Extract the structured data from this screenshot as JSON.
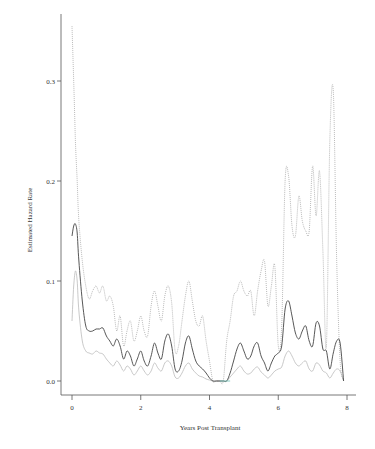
{
  "chart_data": {
    "type": "line",
    "title": "",
    "xlabel": "Years Post Transplant",
    "ylabel": "Estimated Hazard Rate",
    "xlim": [
      0,
      8
    ],
    "ylim": [
      0,
      0.36
    ],
    "xticks": [
      0,
      2,
      4,
      6,
      8
    ],
    "xtick_labels": [
      "0",
      "2",
      "4",
      "6",
      "8"
    ],
    "yticks": [
      0.0,
      0.1,
      0.2,
      0.3
    ],
    "ytick_labels": [
      "0.0",
      "0.1",
      "0.2",
      "0.3"
    ],
    "grid": false,
    "legend": null,
    "series": [
      {
        "name": "estimate",
        "style": "solid",
        "color": "#444444",
        "x": [
          0.0,
          0.05,
          0.1,
          0.15,
          0.2,
          0.3,
          0.4,
          0.5,
          0.6,
          0.7,
          0.8,
          0.9,
          1.0,
          1.1,
          1.2,
          1.3,
          1.4,
          1.5,
          1.6,
          1.7,
          1.8,
          1.9,
          2.0,
          2.1,
          2.2,
          2.3,
          2.4,
          2.5,
          2.6,
          2.7,
          2.8,
          2.9,
          3.0,
          3.1,
          3.2,
          3.3,
          3.4,
          3.5,
          3.6,
          3.7,
          3.8,
          3.9,
          4.0,
          4.1,
          4.2,
          4.3,
          4.4,
          4.5,
          4.6,
          4.7,
          4.8,
          4.9,
          5.0,
          5.1,
          5.2,
          5.3,
          5.4,
          5.5,
          5.6,
          5.7,
          5.8,
          5.9,
          6.0,
          6.1,
          6.2,
          6.3,
          6.4,
          6.5,
          6.6,
          6.7,
          6.8,
          6.9,
          7.0,
          7.1,
          7.2,
          7.3,
          7.4,
          7.5,
          7.6,
          7.7,
          7.8,
          7.9
        ],
        "values": [
          0.145,
          0.155,
          0.157,
          0.148,
          0.12,
          0.08,
          0.055,
          0.05,
          0.05,
          0.052,
          0.052,
          0.053,
          0.045,
          0.04,
          0.035,
          0.042,
          0.035,
          0.022,
          0.03,
          0.025,
          0.015,
          0.022,
          0.03,
          0.02,
          0.015,
          0.025,
          0.038,
          0.028,
          0.022,
          0.04,
          0.047,
          0.035,
          0.012,
          0.01,
          0.02,
          0.038,
          0.045,
          0.032,
          0.02,
          0.015,
          0.012,
          0.008,
          0.003,
          0.0,
          0.0,
          0.0,
          0.0,
          0.0,
          0.008,
          0.02,
          0.032,
          0.038,
          0.03,
          0.022,
          0.025,
          0.035,
          0.038,
          0.025,
          0.018,
          0.01,
          0.018,
          0.025,
          0.028,
          0.035,
          0.072,
          0.08,
          0.065,
          0.048,
          0.042,
          0.05,
          0.055,
          0.04,
          0.035,
          0.058,
          0.055,
          0.032,
          0.03,
          0.012,
          0.028,
          0.04,
          0.038,
          0.0
        ]
      },
      {
        "name": "lower-bound",
        "style": "solid",
        "color": "#bbbbbb",
        "x": [
          0.0,
          0.05,
          0.1,
          0.15,
          0.2,
          0.3,
          0.4,
          0.5,
          0.6,
          0.7,
          0.8,
          0.9,
          1.0,
          1.1,
          1.2,
          1.3,
          1.4,
          1.5,
          1.6,
          1.7,
          1.8,
          1.9,
          2.0,
          2.1,
          2.2,
          2.3,
          2.4,
          2.5,
          2.6,
          2.7,
          2.8,
          2.9,
          3.0,
          3.1,
          3.2,
          3.3,
          3.4,
          3.5,
          3.6,
          3.7,
          3.8,
          3.9,
          4.0,
          4.1,
          4.2,
          4.3,
          4.4,
          4.5,
          4.6,
          4.7,
          4.8,
          4.9,
          5.0,
          5.1,
          5.2,
          5.3,
          5.4,
          5.5,
          5.6,
          5.7,
          5.8,
          5.9,
          6.0,
          6.1,
          6.2,
          6.3,
          6.4,
          6.5,
          6.6,
          6.7,
          6.8,
          6.9,
          7.0,
          7.1,
          7.2,
          7.3,
          7.4,
          7.5,
          7.6,
          7.7,
          7.8,
          7.9
        ],
        "values": [
          0.06,
          0.095,
          0.11,
          0.1,
          0.07,
          0.04,
          0.03,
          0.028,
          0.027,
          0.03,
          0.028,
          0.027,
          0.022,
          0.018,
          0.015,
          0.02,
          0.016,
          0.01,
          0.015,
          0.012,
          0.006,
          0.01,
          0.015,
          0.01,
          0.006,
          0.01,
          0.018,
          0.013,
          0.01,
          0.018,
          0.02,
          0.015,
          0.004,
          0.003,
          0.008,
          0.015,
          0.018,
          0.012,
          0.008,
          0.005,
          0.004,
          0.002,
          0.001,
          0.0,
          0.0,
          0.0,
          0.0,
          0.0,
          0.004,
          0.008,
          0.012,
          0.015,
          0.01,
          0.007,
          0.008,
          0.012,
          0.014,
          0.009,
          0.006,
          0.003,
          0.006,
          0.01,
          0.012,
          0.014,
          0.025,
          0.03,
          0.025,
          0.018,
          0.015,
          0.018,
          0.02,
          0.012,
          0.01,
          0.018,
          0.016,
          0.01,
          0.008,
          0.003,
          0.008,
          0.012,
          0.01,
          0.0
        ]
      },
      {
        "name": "upper-bound",
        "style": "dotted",
        "color": "#aaaaaa",
        "x": [
          0.0,
          0.05,
          0.1,
          0.15,
          0.2,
          0.3,
          0.4,
          0.5,
          0.6,
          0.7,
          0.8,
          0.9,
          1.0,
          1.1,
          1.2,
          1.3,
          1.4,
          1.5,
          1.6,
          1.7,
          1.8,
          1.9,
          2.0,
          2.1,
          2.2,
          2.3,
          2.4,
          2.5,
          2.6,
          2.7,
          2.8,
          2.9,
          3.0,
          3.1,
          3.2,
          3.3,
          3.4,
          3.5,
          3.6,
          3.7,
          3.8,
          3.9,
          4.0,
          4.1,
          4.2,
          4.3,
          4.4,
          4.5,
          4.6,
          4.7,
          4.8,
          4.9,
          5.0,
          5.1,
          5.2,
          5.3,
          5.4,
          5.5,
          5.6,
          5.7,
          5.8,
          5.9,
          6.0,
          6.1,
          6.2,
          6.3,
          6.4,
          6.5,
          6.6,
          6.7,
          6.8,
          6.9,
          7.0,
          7.1,
          7.2,
          7.3,
          7.4,
          7.5,
          7.6,
          7.7,
          7.8,
          7.9
        ],
        "values": [
          0.355,
          0.3,
          0.24,
          0.2,
          0.16,
          0.12,
          0.095,
          0.082,
          0.09,
          0.095,
          0.088,
          0.095,
          0.08,
          0.085,
          0.075,
          0.05,
          0.065,
          0.035,
          0.05,
          0.06,
          0.04,
          0.05,
          0.065,
          0.05,
          0.045,
          0.075,
          0.09,
          0.075,
          0.06,
          0.085,
          0.095,
          0.078,
          0.03,
          0.035,
          0.06,
          0.085,
          0.1,
          0.08,
          0.06,
          0.055,
          0.065,
          0.04,
          0.02,
          0.0,
          0.0,
          0.0,
          0.0,
          0.04,
          0.06,
          0.085,
          0.09,
          0.1,
          0.09,
          0.085,
          0.09,
          0.065,
          0.09,
          0.11,
          0.12,
          0.075,
          0.095,
          0.115,
          0.035,
          0.055,
          0.2,
          0.205,
          0.155,
          0.145,
          0.185,
          0.16,
          0.15,
          0.15,
          0.215,
          0.165,
          0.21,
          0.13,
          0.035,
          0.24,
          0.29,
          0.12,
          0.02,
          0.0
        ]
      }
    ]
  }
}
